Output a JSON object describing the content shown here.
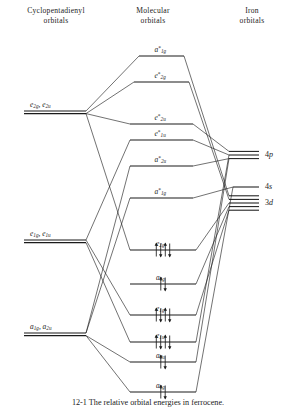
{
  "headers": {
    "left": "Cyclopentadienyl\norbitals",
    "left_line1": "Cyclopentadienyl",
    "left_line2": "orbitals",
    "mid_line1": "Molecular",
    "mid_line2": "orbitals",
    "right_line1": "Iron",
    "right_line2": "orbitals"
  },
  "caption": "12-1  The relative orbital energies in ferrocene.",
  "colors": {
    "ink": "#1a1a1a",
    "background": "#ffffff"
  },
  "ligand_levels": [
    {
      "id": "lig-e2",
      "label": "e2g, e2u",
      "sym1": "e",
      "sub1": "2g",
      "sym2": "e",
      "sub2": "2u",
      "y": 111,
      "x1": 24,
      "x2": 86,
      "degeneracy": 2
    },
    {
      "id": "lig-e1",
      "label": "e1g, e1u",
      "sym1": "e",
      "sub1": "1g",
      "sym2": "e",
      "sub2": "1u",
      "y": 240,
      "x1": 24,
      "x2": 86,
      "degeneracy": 2
    },
    {
      "id": "lig-a1",
      "label": "a1g, a2u",
      "sym1": "a",
      "sub1": "1g",
      "sym2": "a",
      "sub2": "2u",
      "y": 333,
      "x1": 24,
      "x2": 86,
      "degeneracy": 2
    }
  ],
  "mo_levels": [
    {
      "id": "mo-a1g-star-top",
      "sym": "a",
      "sub": "1g",
      "star": "*",
      "y": 56,
      "x1": 139,
      "x2": 184,
      "electrons": 0
    },
    {
      "id": "mo-e2g-star",
      "sym": "e",
      "sub": "2g",
      "star": "*",
      "y": 82,
      "x1": 134,
      "x2": 189,
      "electrons": 0
    },
    {
      "id": "mo-e2u-star",
      "sym": "e",
      "sub": "2u",
      "star": "*",
      "y": 124,
      "x1": 130,
      "x2": 193,
      "electrons": 0
    },
    {
      "id": "mo-e1u-star",
      "sym": "e",
      "sub": "1u",
      "star": "*",
      "y": 140,
      "x1": 130,
      "x2": 193,
      "electrons": 0
    },
    {
      "id": "mo-a2u-star",
      "sym": "a",
      "sub": "2u",
      "star": "*",
      "y": 166,
      "x1": 130,
      "x2": 193,
      "electrons": 0
    },
    {
      "id": "mo-a1g-star",
      "sym": "a",
      "sub": "1g",
      "star": "*",
      "y": 198,
      "x1": 130,
      "x2": 193,
      "electrons": 0
    },
    {
      "id": "mo-e2g",
      "sym": "e",
      "sub": "2g",
      "star": "",
      "y": 250,
      "x1": 130,
      "x2": 196,
      "electrons": 4
    },
    {
      "id": "mo-a1g-nb",
      "sym": "a",
      "sub": "1g",
      "star": "",
      "y": 284,
      "x1": 130,
      "x2": 196,
      "electrons": 2
    },
    {
      "id": "mo-e1g",
      "sym": "e",
      "sub": "1g",
      "star": "",
      "y": 315,
      "x1": 130,
      "x2": 196,
      "electrons": 4
    },
    {
      "id": "mo-e1u",
      "sym": "e",
      "sub": "1u",
      "star": "",
      "y": 342,
      "x1": 130,
      "x2": 196,
      "electrons": 4
    },
    {
      "id": "mo-a2u",
      "sym": "a",
      "sub": "2u",
      "star": "",
      "y": 362,
      "x1": 130,
      "x2": 196,
      "electrons": 2
    },
    {
      "id": "mo-a1g-bot",
      "sym": "a",
      "sub": "1g",
      "star": "",
      "y": 392,
      "x1": 130,
      "x2": 196,
      "electrons": 2
    }
  ],
  "metal_levels": [
    {
      "id": "ao-4p",
      "label": "4p",
      "n": "4",
      "orbital": "p",
      "y": 155,
      "lines": 3,
      "spacing": 3.6,
      "x1": 229,
      "x2": 259
    },
    {
      "id": "ao-4s",
      "label": "4s",
      "n": "4",
      "orbital": "s",
      "y": 187,
      "lines": 1,
      "spacing": 0,
      "x1": 233,
      "x2": 259
    },
    {
      "id": "ao-3d",
      "label": "3d",
      "n": "3",
      "orbital": "d",
      "y": 203,
      "lines": 5,
      "spacing": 3.6,
      "x1": 229,
      "x2": 259
    }
  ]
}
